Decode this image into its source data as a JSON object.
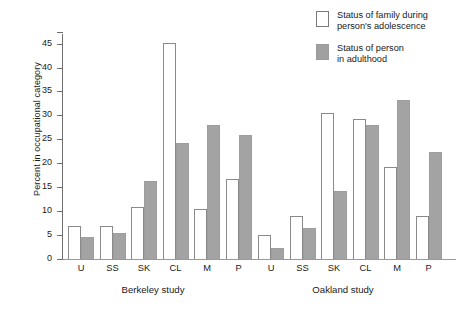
{
  "chart_data": {
    "type": "bar",
    "title": "",
    "xlabel": "",
    "ylabel": "Percent in occupational category",
    "ylim": [
      0,
      47
    ],
    "yticks": [
      0,
      5,
      10,
      15,
      20,
      25,
      30,
      35,
      40,
      45
    ],
    "grid": false,
    "legend_position": "top-right",
    "groups": [
      {
        "name": "Berkeley study",
        "categories": [
          "U",
          "SS",
          "SK",
          "CL",
          "M",
          "P"
        ]
      },
      {
        "name": "Oakland study",
        "categories": [
          "U",
          "SS",
          "SK",
          "CL",
          "M",
          "P"
        ]
      }
    ],
    "categories": [
      "U",
      "SS",
      "SK",
      "CL",
      "M",
      "P"
    ],
    "series": [
      {
        "name": "Status of family during person's adolescence",
        "color": "#ffffff",
        "berkeley": [
          7.0,
          7.0,
          10.8,
          45.2,
          10.5,
          16.7
        ],
        "oakland": [
          5.0,
          9.0,
          30.5,
          29.2,
          19.2,
          9.0
        ]
      },
      {
        "name": "Status of person in adulthood",
        "color": "#a3a3a3",
        "berkeley": [
          4.5,
          5.5,
          16.2,
          24.3,
          28.0,
          26.0
        ],
        "oakland": [
          2.3,
          6.5,
          14.2,
          28.0,
          33.2,
          22.3
        ]
      }
    ]
  },
  "legend": {
    "items": [
      {
        "swatch": "open",
        "label": "Status of family during\nperson's adolescence"
      },
      {
        "swatch": "filled",
        "label": "Status of person\nin adulthood"
      }
    ]
  },
  "axis": {
    "y_title": "Percent in occupational category",
    "y_tick_labels": [
      "45",
      "40",
      "35",
      "30",
      "25",
      "20",
      "15",
      "10",
      "5",
      "0"
    ]
  },
  "x_axis": {
    "berkeley_label": "Berkeley study",
    "oakland_label": "Oakland study",
    "berkeley_ticks": [
      "U",
      "SS",
      "SK",
      "CL",
      "M",
      "P"
    ],
    "oakland_ticks": [
      "U",
      "SS",
      "SK",
      "CL",
      "M",
      "P"
    ]
  },
  "colors": {
    "open_bar": "#ffffff",
    "filled_bar": "#a3a3a3",
    "axis": "#6e6e6e",
    "text": "#1a1a1a"
  }
}
